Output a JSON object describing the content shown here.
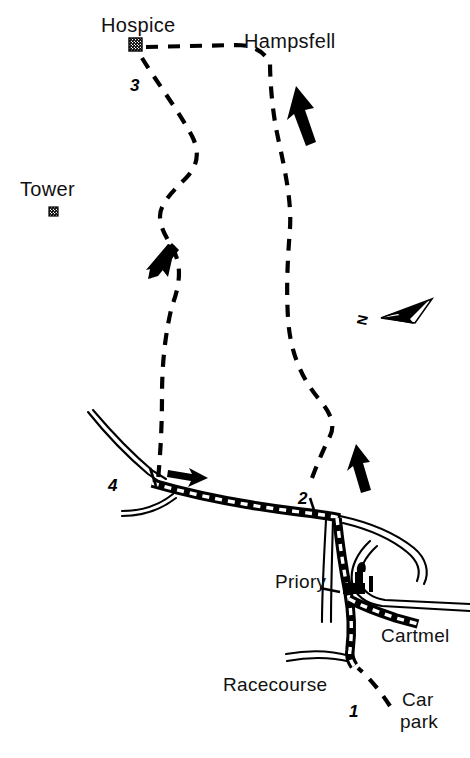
{
  "map": {
    "title": "Hampsfell walking route map",
    "background_color": "#ffffff",
    "ink_color": "#000000",
    "width": 470,
    "height": 758,
    "labels": {
      "hospice": "Hospice",
      "hampsfell": "Hampsfell",
      "tower": "Tower",
      "priory": "Priory",
      "cartmel": "Cartmel",
      "racecourse": "Racecourse",
      "car_park_line1": "Car",
      "car_park_line2": "park"
    },
    "waypoints": [
      {
        "number": "1",
        "label": "1",
        "near": "Car park / Racecourse junction"
      },
      {
        "number": "2",
        "label": "2",
        "near": "main road, east trail junction"
      },
      {
        "number": "3",
        "label": "3",
        "near": "Hospice"
      },
      {
        "number": "4",
        "label": "4",
        "near": "main road, west trail junction"
      }
    ],
    "compass": {
      "letter": "N",
      "direction": "north-east",
      "name": "north-arrow"
    },
    "features": {
      "hospice_marker": "hatched-square-marker",
      "tower_marker": "hatched-square-marker",
      "priory_marker": "priory-building-icon",
      "trail_style": "dashed-footpath",
      "road_style": "black-band-with-white-dashes",
      "direction_arrows": 4
    }
  }
}
